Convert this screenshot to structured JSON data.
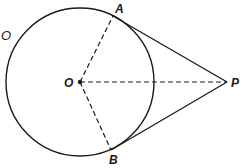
{
  "diagram": {
    "circle": {
      "label": "O",
      "cx": 80,
      "cy": 82,
      "r": 74
    },
    "points": {
      "center": {
        "label": "O",
        "x": 80,
        "y": 82
      },
      "A": {
        "label": "A",
        "x": 113,
        "y": 16
      },
      "B": {
        "label": "B",
        "x": 111,
        "y": 150
      },
      "P": {
        "label": "P",
        "x": 227,
        "y": 82
      }
    },
    "segments": [
      {
        "from": "O",
        "to": "A",
        "style": "dashed"
      },
      {
        "from": "O",
        "to": "B",
        "style": "dashed"
      },
      {
        "from": "O",
        "to": "P",
        "style": "dashed"
      },
      {
        "from": "A",
        "to": "P",
        "style": "solid"
      },
      {
        "from": "B",
        "to": "P",
        "style": "solid"
      }
    ],
    "colors": {
      "stroke": "#1a1a1a",
      "background": "#ffffff"
    }
  }
}
